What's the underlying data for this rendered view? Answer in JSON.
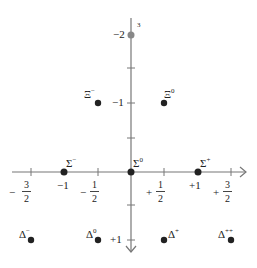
{
  "axes": {
    "horizontal_ticks": [
      {
        "sign": "−",
        "num": "3",
        "den": "2"
      },
      {
        "label": "−1"
      },
      {
        "sign": "−",
        "num": "1",
        "den": "2"
      },
      {
        "sign": "+",
        "num": "1",
        "den": "2"
      },
      {
        "label": "+1"
      },
      {
        "sign": "+",
        "num": "3",
        "den": "2"
      }
    ],
    "vertical_ticks": {
      "minus2": "−2",
      "minus1": "−1",
      "plus1": "+1"
    },
    "top_marker": "3"
  },
  "particles": {
    "xi_minus": {
      "symbol": "Ξ",
      "charge": "−"
    },
    "xi_zero": {
      "symbol": "Ξ",
      "charge": "0"
    },
    "sigma_minus": {
      "symbol": "Σ",
      "charge": "−"
    },
    "sigma_zero": {
      "symbol": "Σ",
      "charge": "0"
    },
    "sigma_plus": {
      "symbol": "Σ",
      "charge": "+"
    },
    "delta_minus": {
      "symbol": "Δ",
      "charge": "−"
    },
    "delta_zero": {
      "symbol": "Δ",
      "charge": "0"
    },
    "delta_plus": {
      "symbol": "Δ",
      "charge": "+"
    },
    "delta_plusplus": {
      "symbol": "Δ",
      "charge": "++"
    }
  },
  "colors": {
    "axis": "#777777",
    "dot": "#222222",
    "top_dot": "#888888"
  }
}
